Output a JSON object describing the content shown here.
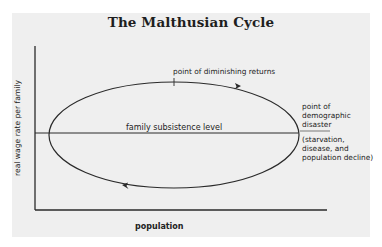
{
  "title": "The Malthusian Cycle",
  "axes": {
    "y_label": "real wage rate per family",
    "x_label": "population"
  },
  "annotations": {
    "diminishing_returns": "point of diminishing returns",
    "subsistence": "family subsistence level",
    "disaster_line1": "point of",
    "disaster_line2": "demographic",
    "disaster_line3": "disaster",
    "disaster_detail1": "(starvation,",
    "disaster_detail2": "disease, and",
    "disaster_detail3": "population decline)"
  },
  "colors": {
    "background_panel": "#efefef",
    "line": "#2a2a2a",
    "text": "#222222"
  }
}
